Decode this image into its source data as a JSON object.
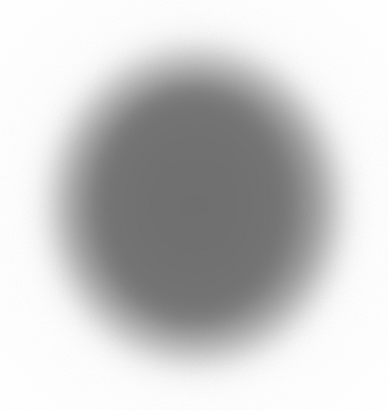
{
  "image": {
    "kind": "blurred-grayscale-blob",
    "width": 388,
    "height": 410,
    "background_color": "#ffffff",
    "alt_text": "A large, heavily blurred gray circular blob centered on a white background",
    "caption": ""
  },
  "blob": {
    "shape": "ellipse",
    "center_x": 196,
    "center_y": 206,
    "core_label": "inner core disk",
    "core_color": "#767676",
    "core_radius_x": 107,
    "core_radius_y": 124,
    "halo_label": "outer soft halo",
    "halo_color": "#8d8d8d",
    "halo_radius_x": 180,
    "halo_radius_y": 196,
    "edge_feather_px": 34,
    "bounds": {
      "left": 18,
      "top": 22,
      "right": 375,
      "bottom": 395
    }
  },
  "texture": {
    "label": "film grain",
    "opacity": 0.085
  }
}
